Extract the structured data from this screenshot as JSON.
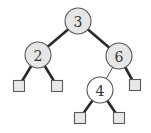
{
  "diagram": {
    "type": "binary-search-tree",
    "colors": {
      "node_fill": "#e6e6e6",
      "highlight_node_fill": "#ffffff",
      "leaf_fill": "#e8e8e8",
      "edge": "#2a2a2a"
    },
    "nodes": [
      {
        "id": "n3",
        "label": "3",
        "x": 78,
        "y": 21,
        "r": 13,
        "fill": "#e6e6e6"
      },
      {
        "id": "n2",
        "label": "2",
        "x": 38,
        "y": 55,
        "r": 13,
        "fill": "#e6e6e6"
      },
      {
        "id": "n6",
        "label": "6",
        "x": 119,
        "y": 56,
        "r": 13,
        "fill": "#e6e6e6"
      },
      {
        "id": "n4",
        "label": "4",
        "x": 100,
        "y": 90,
        "r": 13,
        "fill": "#ffffff"
      }
    ],
    "leaves": [
      {
        "id": "l1",
        "parent": "n2",
        "x": 19,
        "y": 86,
        "size": 11
      },
      {
        "id": "l2",
        "parent": "n2",
        "x": 57,
        "y": 86,
        "size": 11
      },
      {
        "id": "l3",
        "parent": "n6",
        "x": 135,
        "y": 85,
        "size": 11
      },
      {
        "id": "l4",
        "parent": "n4",
        "x": 80,
        "y": 118,
        "size": 11
      },
      {
        "id": "l5",
        "parent": "n4",
        "x": 119,
        "y": 118,
        "size": 11
      }
    ],
    "edges": [
      {
        "from": "n3",
        "to": "n2",
        "style": "thick"
      },
      {
        "from": "n3",
        "to": "n6",
        "style": "thick"
      },
      {
        "from": "n2",
        "to": "l1",
        "style": "thick"
      },
      {
        "from": "n2",
        "to": "l2",
        "style": "thick"
      },
      {
        "from": "n6",
        "to": "n4",
        "style": "thin"
      },
      {
        "from": "n6",
        "to": "l3",
        "style": "thick"
      },
      {
        "from": "n4",
        "to": "l4",
        "style": "thick"
      },
      {
        "from": "n4",
        "to": "l5",
        "style": "thick"
      }
    ]
  }
}
